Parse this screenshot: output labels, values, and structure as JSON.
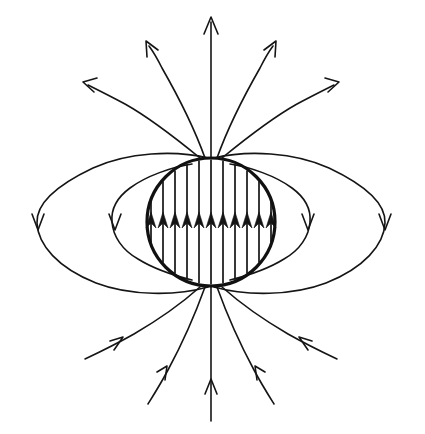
{
  "figure": {
    "caption": "",
    "background_color": "#ffffff",
    "line_color": "#151515",
    "outline_color": "#111111",
    "canvas": {
      "width": 425,
      "height": 434
    }
  },
  "chart_data": {
    "type": "diagram",
    "subtype": "vector-field-lines",
    "xlabel": "",
    "ylabel": "",
    "xlim": [
      0,
      425
    ],
    "ylim": [
      0,
      434
    ],
    "grid": false,
    "legend": null,
    "annotations": [],
    "sphere": {
      "label": "magnetized-sphere",
      "center_x": 211,
      "center_y": 222,
      "radius": 64,
      "stroke_width": 3.2,
      "fill": "none"
    },
    "interior_field": {
      "label": "uniform-interior-field",
      "direction": "up",
      "line_count": 11,
      "spacing_px": 12,
      "arrow_tip_y": 212,
      "x_positions": [
        151,
        163,
        175,
        187,
        199,
        211,
        223,
        235,
        247,
        259,
        271
      ]
    },
    "closed_loops": [
      {
        "name": "inner-left-loop",
        "side": "left",
        "arrow_x": 115,
        "arrow_y": 222,
        "arrow_dir": "down",
        "extent_x": 112,
        "top_y": 170,
        "bottom_y": 276
      },
      {
        "name": "outer-left-loop",
        "side": "left",
        "arrow_x": 38,
        "arrow_y": 222,
        "arrow_dir": "down",
        "extent_x": 37,
        "top_y": 155,
        "bottom_y": 292
      },
      {
        "name": "inner-right-loop",
        "side": "right",
        "arrow_x": 308,
        "arrow_y": 222,
        "arrow_dir": "down",
        "extent_x": 311,
        "top_y": 170,
        "bottom_y": 276
      },
      {
        "name": "outer-right-loop",
        "side": "right",
        "arrow_x": 385,
        "arrow_y": 222,
        "arrow_dir": "down",
        "extent_x": 386,
        "top_y": 155,
        "bottom_y": 292
      }
    ],
    "open_lines_top": [
      {
        "name": "top-far-left",
        "arrow_tip_x": 83,
        "arrow_tip_y": 82,
        "arrow_dir": "up-left"
      },
      {
        "name": "top-mid-left",
        "arrow_tip_x": 147,
        "arrow_tip_y": 42,
        "arrow_dir": "up-left"
      },
      {
        "name": "top-center",
        "arrow_tip_x": 211,
        "arrow_tip_y": 18,
        "arrow_dir": "up"
      },
      {
        "name": "top-mid-right",
        "arrow_tip_x": 274,
        "arrow_tip_y": 42,
        "arrow_dir": "up-right"
      },
      {
        "name": "top-far-right",
        "arrow_tip_x": 340,
        "arrow_tip_y": 82,
        "arrow_dir": "up-right"
      }
    ],
    "open_lines_bottom": [
      {
        "name": "bottom-far-left",
        "arrow_tip_x": 120,
        "arrow_tip_y": 344,
        "arrow_dir": "up-right"
      },
      {
        "name": "bottom-mid-left",
        "arrow_tip_x": 164,
        "arrow_tip_y": 371,
        "arrow_dir": "up-right"
      },
      {
        "name": "bottom-center",
        "arrow_tip_x": 211,
        "arrow_tip_y": 380,
        "arrow_dir": "up"
      },
      {
        "name": "bottom-mid-right",
        "arrow_tip_x": 258,
        "arrow_tip_y": 371,
        "arrow_dir": "up-left"
      },
      {
        "name": "bottom-far-right",
        "arrow_tip_x": 303,
        "arrow_tip_y": 344,
        "arrow_dir": "up-left"
      }
    ]
  }
}
